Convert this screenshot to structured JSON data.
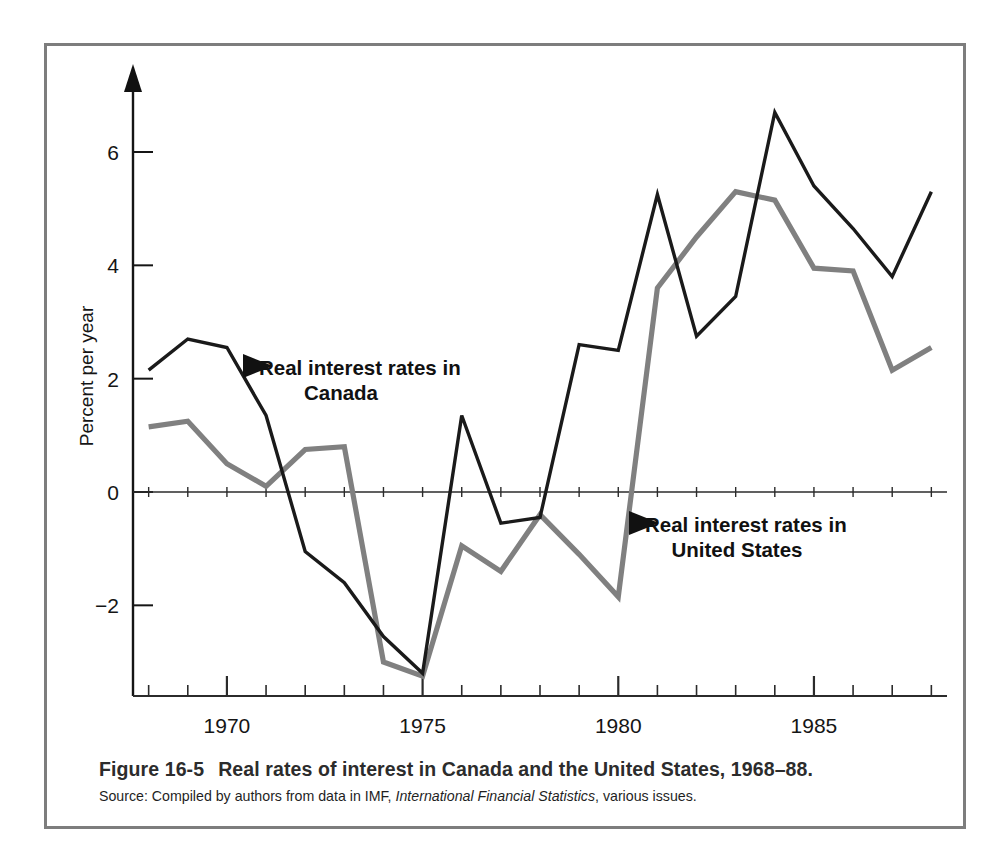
{
  "figure": {
    "caption_number": "Figure 16-5",
    "caption_text": "Real rates of interest in Canada and the United States, 1968–88.",
    "source_prefix": "Source: Compiled by authors from data in IMF, ",
    "source_italic": "International Financial Statistics",
    "source_suffix": ", various issues."
  },
  "chart_data": {
    "type": "line",
    "xlabel": "",
    "ylabel": "Percent per year",
    "x": [
      1968,
      1969,
      1970,
      1971,
      1972,
      1973,
      1974,
      1975,
      1976,
      1977,
      1978,
      1979,
      1980,
      1981,
      1982,
      1983,
      1984,
      1985,
      1986,
      1987,
      1988
    ],
    "xlim": [
      1967.6,
      1988.4
    ],
    "ylim": [
      -3.6,
      7.2
    ],
    "xticks": [
      1968,
      1969,
      1970,
      1971,
      1972,
      1973,
      1974,
      1975,
      1976,
      1977,
      1978,
      1979,
      1980,
      1981,
      1982,
      1983,
      1984,
      1985,
      1986,
      1987,
      1988
    ],
    "xtick_labels": [
      "1970",
      "1975",
      "1980",
      "1985"
    ],
    "xtick_label_values": [
      1970,
      1975,
      1980,
      1985
    ],
    "yticks": [
      -2,
      0,
      2,
      4,
      6
    ],
    "ytick_labels": [
      "−2",
      "0",
      "2",
      "4",
      "6"
    ],
    "grid": false,
    "zero_line": true,
    "legend_position": "inline-annotations",
    "series": [
      {
        "name": "Real interest rates in Canada",
        "color": "#1a1a1a",
        "line_width": 3.4,
        "values": [
          2.15,
          2.7,
          2.55,
          1.35,
          -1.05,
          -1.6,
          -2.55,
          -3.2,
          1.35,
          -0.55,
          -0.45,
          2.6,
          2.5,
          5.25,
          2.75,
          3.45,
          6.7,
          5.4,
          4.65,
          3.8,
          5.3
        ]
      },
      {
        "name": "Real interest rates in United States",
        "color": "#808080",
        "line_width": 5.2,
        "values": [
          1.15,
          1.25,
          0.5,
          0.1,
          0.75,
          0.8,
          -3.0,
          -3.25,
          -0.95,
          -1.4,
          -0.4,
          -1.1,
          -1.85,
          3.6,
          4.5,
          5.3,
          5.15,
          3.95,
          3.9,
          2.15,
          2.55
        ]
      }
    ],
    "annotations": [
      {
        "name": "canada-annotation",
        "line1": "Real interest rates in",
        "line2": "Canada",
        "marker": "left-triangle",
        "target_x": 1971.1,
        "target_y": 2.4
      },
      {
        "name": "united-states-annotation",
        "line1": "Real interest rates in",
        "line2": "United States",
        "marker": "left-triangle",
        "target_x": 1980.85,
        "target_y": -1.2
      }
    ]
  }
}
